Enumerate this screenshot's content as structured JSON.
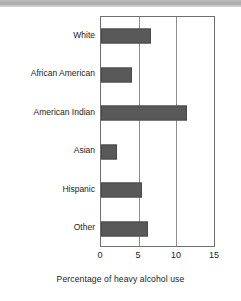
{
  "chart_data": {
    "type": "bar",
    "orientation": "horizontal",
    "title": "",
    "xlabel": "Percentage of heavy alcohol use",
    "ylabel": "",
    "categories": [
      "White",
      "African American",
      "American Indian",
      "Asian",
      "Hispanic",
      "Other"
    ],
    "values": [
      6.7,
      4.1,
      11.4,
      2.1,
      5.4,
      6.2
    ],
    "series": [
      {
        "name": "Percentage of heavy alcohol use",
        "values": [
          6.7,
          4.1,
          11.4,
          2.1,
          5.4,
          6.2
        ]
      }
    ],
    "xlim": [
      0,
      15
    ],
    "xticks": [
      0,
      5,
      10,
      15
    ],
    "xtick_labels": [
      "0",
      "5",
      "10",
      "15"
    ],
    "grid": "vertical",
    "legend": "none",
    "bar_color": "#595959",
    "frame_color": "#6f6f6f",
    "background_color": "#ffffff"
  },
  "axis": {
    "tick_labels": [
      "0",
      "5",
      "10",
      "15"
    ],
    "title": "Percentage of heavy alcohol use"
  },
  "bars": [
    {
      "label": "White",
      "value": 6.7
    },
    {
      "label": "African American",
      "value": 4.1
    },
    {
      "label": "American Indian",
      "value": 11.4
    },
    {
      "label": "Asian",
      "value": 2.1
    },
    {
      "label": "Hispanic",
      "value": 5.4
    },
    {
      "label": "Other",
      "value": 6.2
    }
  ]
}
